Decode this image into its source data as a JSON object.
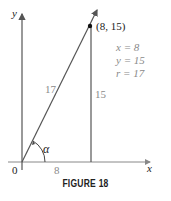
{
  "figure": {
    "caption": "FIGURE 18",
    "axes": {
      "x_label": "x",
      "y_label": "y",
      "origin_label": "0"
    },
    "point": {
      "label": "(8, 15)",
      "x": 8,
      "y": 15
    },
    "segments": {
      "hypotenuse_label": "17",
      "vertical_label": "15",
      "horizontal_label": "8"
    },
    "angle_label": "α",
    "values": {
      "x_line": "x = 8",
      "y_line": "y = 15",
      "r_line": "r = 17"
    },
    "colors": {
      "axis": "#888888",
      "line": "#444444",
      "label_gray": "#8a8a8a",
      "text": "#222222"
    }
  }
}
